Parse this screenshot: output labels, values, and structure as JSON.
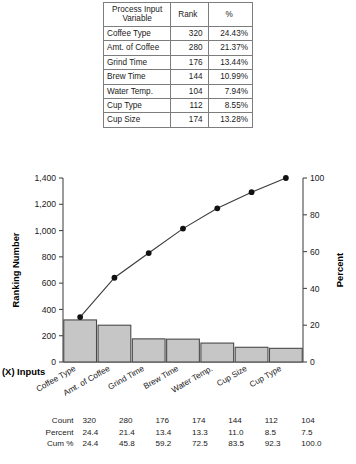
{
  "rank_table": {
    "headers": [
      "Process Input Variable",
      "Rank",
      "%"
    ],
    "header_var_line1": "Process Input",
    "header_var_line2": "Variable",
    "header_rank": "Rank",
    "header_pct": "%",
    "rows": [
      {
        "variable": "Coffee Type",
        "rank": "320",
        "pct": "24.43%"
      },
      {
        "variable": "Amt. of Coffee",
        "rank": "280",
        "pct": "21.37%"
      },
      {
        "variable": "Grind Time",
        "rank": "176",
        "pct": "13.44%"
      },
      {
        "variable": "Brew Time",
        "rank": "144",
        "pct": "10.99%"
      },
      {
        "variable": "Water Temp.",
        "rank": "104",
        "pct": "7.94%"
      },
      {
        "variable": "Cup Type",
        "rank": "112",
        "pct": "8.55%"
      },
      {
        "variable": "Cup Size",
        "rank": "174",
        "pct": "13.28%"
      }
    ]
  },
  "chart_data": {
    "type": "bar",
    "title": "",
    "subtype": "pareto",
    "xlabel": "(X) Inputs",
    "ylabel": "Ranking Number",
    "y2label": "Percent",
    "categories": [
      "Coffee Type",
      "Amt. of Coffee",
      "Grind Time",
      "Brew Time",
      "Water Temp.",
      "Cup Size",
      "Cup Type"
    ],
    "values": [
      320,
      280,
      176,
      174,
      144,
      112,
      104
    ],
    "cumulative_percent": [
      24.4,
      45.8,
      59.2,
      72.5,
      83.5,
      92.3,
      100.0
    ],
    "percent": [
      24.4,
      21.4,
      13.4,
      13.3,
      11.0,
      8.5,
      7.5
    ],
    "ylim": [
      0,
      1400
    ],
    "yticks": [
      "0",
      "200",
      "400",
      "600",
      "800",
      "1,000",
      "1,200",
      "1,400"
    ],
    "ytick_values": [
      0,
      200,
      400,
      600,
      800,
      1000,
      1200,
      1400
    ],
    "y2lim": [
      0,
      100
    ],
    "y2ticks": [
      "0",
      "20",
      "40",
      "60",
      "80",
      "100"
    ],
    "y2tick_values": [
      0,
      20,
      40,
      60,
      80,
      100
    ],
    "grid": false,
    "legend": "none",
    "bar_color": "#c6c6c6",
    "line_color": "#3a3a3a"
  },
  "stats_table": {
    "row_labels": [
      "Count",
      "Percent",
      "Cum %"
    ],
    "count": [
      "320",
      "280",
      "176",
      "174",
      "144",
      "112",
      "104"
    ],
    "percent": [
      "24.4",
      "21.4",
      "13.4",
      "13.3",
      "11.0",
      "8.5",
      "7.5"
    ],
    "cum": [
      "24.4",
      "45.8",
      "59.2",
      "72.5",
      "83.5",
      "92.3",
      "100.0"
    ]
  }
}
